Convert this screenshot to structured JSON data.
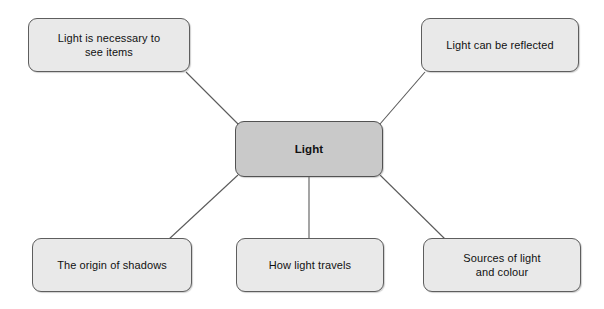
{
  "diagram": {
    "type": "mind-map",
    "title": "Light",
    "background_color": "#ffffff",
    "center_node": {
      "id": "center",
      "label": "Light",
      "fill": "#c9c9c9",
      "stroke": "#525252",
      "bold": true
    },
    "nodes": [
      {
        "id": "topleft",
        "label": "Light is necessary to\nsee items",
        "fill": "#e9e9e9",
        "stroke": "#5e5e5e",
        "position": "top-left"
      },
      {
        "id": "topright",
        "label": "Light can be reflected",
        "fill": "#e9e9e9",
        "stroke": "#5e5e5e",
        "position": "top-right"
      },
      {
        "id": "bottomleft",
        "label": "The origin of shadows",
        "fill": "#e9e9e9",
        "stroke": "#5e5e5e",
        "position": "bottom-left"
      },
      {
        "id": "bottomcenter",
        "label": "How light travels",
        "fill": "#e9e9e9",
        "stroke": "#5e5e5e",
        "position": "bottom-center"
      },
      {
        "id": "bottomright",
        "label": "Sources of light\nand colour",
        "fill": "#e9e9e9",
        "stroke": "#5e5e5e",
        "position": "bottom-right"
      }
    ],
    "edges": [
      {
        "id": "edge-center-topleft",
        "from": "center",
        "to": "topleft",
        "x1": 238,
        "y1": 124,
        "x2": 186,
        "y2": 72
      },
      {
        "id": "edge-center-topright",
        "from": "center",
        "to": "topright",
        "x1": 380,
        "y1": 124,
        "x2": 425,
        "y2": 72
      },
      {
        "id": "edge-center-bottomleft",
        "from": "center",
        "to": "bottomleft",
        "x1": 238,
        "y1": 175,
        "x2": 168,
        "y2": 240
      },
      {
        "id": "edge-center-bottomcenter",
        "from": "center",
        "to": "bottomcenter",
        "x1": 309,
        "y1": 177,
        "x2": 309,
        "y2": 238
      },
      {
        "id": "edge-center-bottomright",
        "from": "center",
        "to": "bottomright",
        "x1": 380,
        "y1": 175,
        "x2": 446,
        "y2": 240
      }
    ],
    "edge_color": "#5a5a5a"
  }
}
